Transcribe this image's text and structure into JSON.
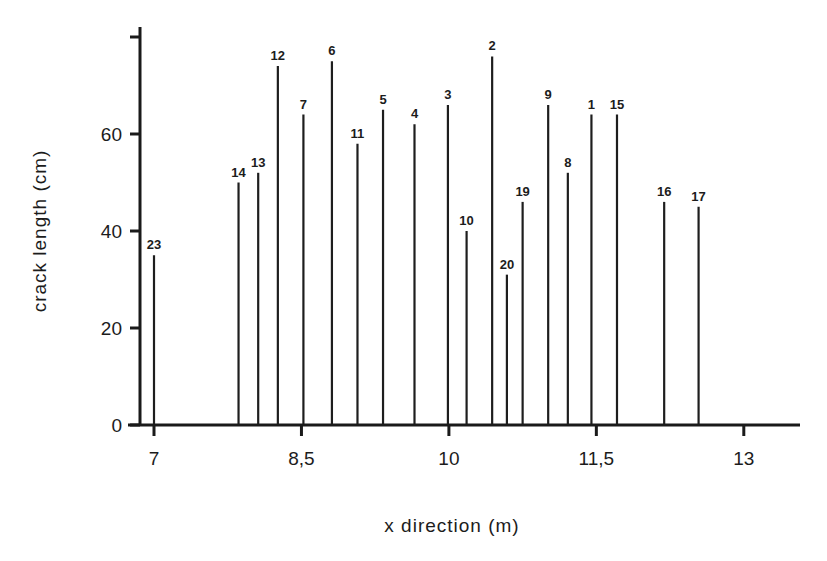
{
  "chart_data": {
    "type": "bar",
    "subtype": "stem / vertical line plot",
    "title": "",
    "xlabel": "x direction (m)",
    "ylabel": "crack length (cm)",
    "xlim": [
      6.85,
      13.6
    ],
    "ylim": [
      0,
      82
    ],
    "xticks": [
      7,
      8.5,
      10,
      11.5,
      13
    ],
    "xtick_labels": [
      "7",
      "8,5",
      "10",
      "11,5",
      "13"
    ],
    "yticks": [
      0,
      20,
      40,
      60,
      80
    ],
    "ytick_labels": [
      "0",
      "20",
      "40",
      "60",
      ""
    ],
    "grid": false,
    "legend": null,
    "series": [
      {
        "name": "cracks",
        "points": [
          {
            "id": "23",
            "x": 7.0,
            "y": 35
          },
          {
            "id": "14",
            "x": 7.86,
            "y": 50
          },
          {
            "id": "13",
            "x": 8.06,
            "y": 52
          },
          {
            "id": "12",
            "x": 8.26,
            "y": 74
          },
          {
            "id": "7",
            "x": 8.52,
            "y": 64
          },
          {
            "id": "6",
            "x": 8.81,
            "y": 75
          },
          {
            "id": "11",
            "x": 9.07,
            "y": 58
          },
          {
            "id": "5",
            "x": 9.33,
            "y": 65
          },
          {
            "id": "4",
            "x": 9.65,
            "y": 62
          },
          {
            "id": "3",
            "x": 9.99,
            "y": 66
          },
          {
            "id": "10",
            "x": 10.18,
            "y": 40
          },
          {
            "id": "2",
            "x": 10.44,
            "y": 76
          },
          {
            "id": "20",
            "x": 10.59,
            "y": 31
          },
          {
            "id": "19",
            "x": 10.75,
            "y": 46
          },
          {
            "id": "9",
            "x": 11.01,
            "y": 66
          },
          {
            "id": "8",
            "x": 11.21,
            "y": 52
          },
          {
            "id": "1",
            "x": 11.45,
            "y": 64
          },
          {
            "id": "15",
            "x": 11.71,
            "y": 64
          },
          {
            "id": "16",
            "x": 12.19,
            "y": 46
          },
          {
            "id": "17",
            "x": 12.54,
            "y": 45
          }
        ]
      }
    ]
  },
  "colors": {
    "ink": "#1e1e1e",
    "background": "#ffffff"
  },
  "layout": {
    "x0_px": 154,
    "x_px_per_unit": 98.3,
    "y0_px": 425,
    "y_px_per_unit": 4.85,
    "yaxis_x_px": 140,
    "yaxis_top_px": 27,
    "xaxis_left_px": 128,
    "xaxis_right_px": 800
  }
}
